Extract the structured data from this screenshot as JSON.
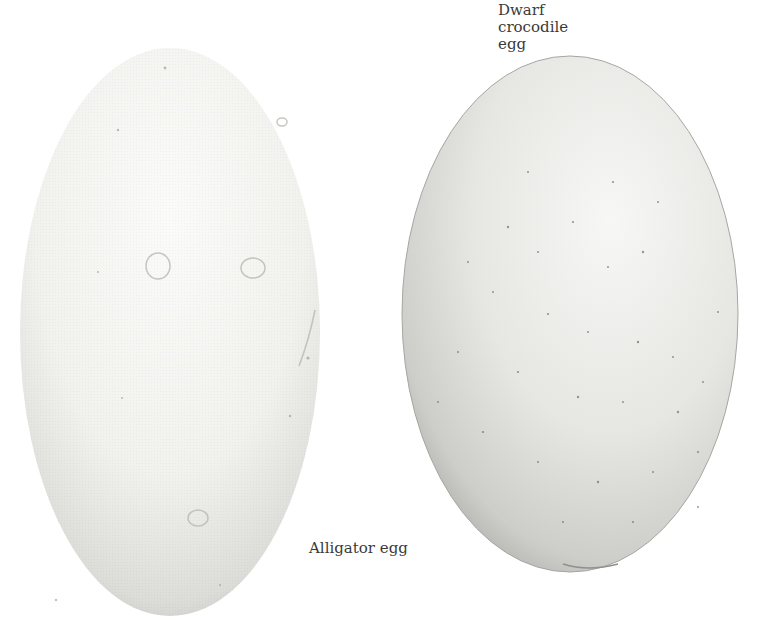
{
  "labels": {
    "dwarf_crocodile_egg": [
      "Dwarf",
      "crocodile",
      "egg"
    ],
    "alligator_egg": "Alligator egg"
  },
  "eggs": [
    {
      "name": "alligator-egg",
      "shape": "elongated oval",
      "surface": "pale, bumpy, chalky"
    },
    {
      "name": "dwarf-crocodile-egg",
      "shape": "broad oval",
      "surface": "grey, finely speckled"
    }
  ],
  "colors": {
    "background": "#ffffff",
    "alligator_shell_light": "#f7f7f5",
    "alligator_shell_shadow": "#d6d6d2",
    "crocodile_shell_light": "#efefed",
    "crocodile_shell_shadow": "#bdbdb9",
    "label_text": "#3a3a3a"
  }
}
